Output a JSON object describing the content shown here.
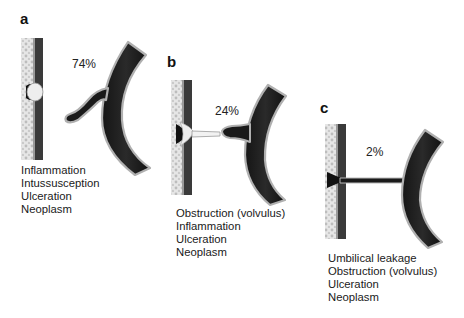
{
  "figure": {
    "panels": [
      {
        "label": "a",
        "percentage": "74%",
        "causes": [
          "Inflammation",
          "Intussusception",
          "Ulceration",
          "Neoplasm"
        ]
      },
      {
        "label": "b",
        "percentage": "24%",
        "causes": [
          "Obstruction (volvulus)",
          "Inflammation",
          "Ulceration",
          "Neoplasm"
        ]
      },
      {
        "label": "c",
        "percentage": "2%",
        "causes": [
          "Umbilical leakage",
          "Obstruction (volvulus)",
          "Ulceration",
          "Neoplasm"
        ]
      }
    ],
    "colors": {
      "bowel_dark": "#1c1c1c",
      "wall_light": "#e2e2e2",
      "wall_dark": "#333333",
      "outline": "#a8a8a8"
    }
  }
}
